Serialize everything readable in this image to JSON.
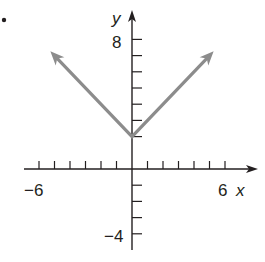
{
  "problem_fragment": "9.",
  "chart_data": {
    "type": "line",
    "title": "",
    "function": "y = |x| + 2",
    "xlabel": "x",
    "ylabel": "y",
    "xlim": [
      -6,
      6
    ],
    "ylim": [
      -4,
      8
    ],
    "x_tick_labels": [
      "-6",
      "6"
    ],
    "y_tick_labels": [
      "8",
      "-4"
    ],
    "x_ticks": [
      -6,
      -5,
      -4,
      -3,
      -2,
      -1,
      1,
      2,
      3,
      4,
      5,
      6
    ],
    "y_ticks": [
      -4,
      -3,
      -2,
      -1,
      2,
      3,
      4,
      5,
      6,
      7,
      8
    ],
    "grid": false,
    "series": [
      {
        "name": "y = |x| + 2",
        "x": [
          -5,
          0,
          5
        ],
        "y": [
          7,
          2,
          7
        ],
        "color": "#8c8c8c",
        "arrows": "both-ends"
      }
    ]
  },
  "labels": {
    "x_axis": "x",
    "y_axis": "y",
    "x_min": "−6",
    "x_max": "6",
    "y_max": "8",
    "y_min": "−4"
  },
  "colors": {
    "axis": "#231f20",
    "curve": "#8c8c8c",
    "background": "#ffffff"
  }
}
